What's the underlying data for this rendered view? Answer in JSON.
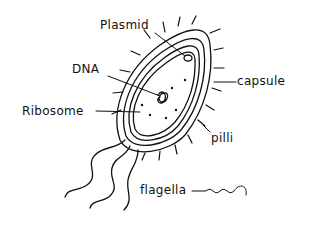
{
  "diagram": {
    "style": "hand-drawn line art",
    "colors": {
      "ink": "#111111",
      "background": "#ffffff"
    },
    "labels": [
      {
        "id": "plasmid",
        "text": "Plasmid"
      },
      {
        "id": "dna",
        "text": "DNA"
      },
      {
        "id": "capsule",
        "text": "capsule"
      },
      {
        "id": "ribosome",
        "text": "Ribosome"
      },
      {
        "id": "pilli",
        "text": "pilli"
      },
      {
        "id": "flagella",
        "text": "flagella"
      }
    ]
  }
}
